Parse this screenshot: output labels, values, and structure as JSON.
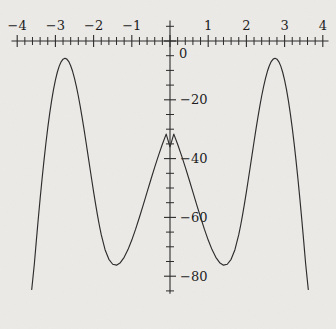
{
  "figure": {
    "background_color": "#eceae7",
    "ink_color": "#2a2a2a",
    "width": 336,
    "height": 329
  },
  "chart_data": {
    "type": "line",
    "title": "",
    "subtitle": "",
    "xlabel": "",
    "ylabel": "",
    "grid": false,
    "legend": null,
    "legend_position": "none",
    "xlim": [
      -4.15,
      4.15
    ],
    "ylim": [
      -86,
      10
    ],
    "x_major_ticks": [
      -4,
      -3,
      -2,
      -1,
      0,
      1,
      2,
      3,
      4
    ],
    "x_major_tick_labels": [
      "−4",
      "−3",
      "−2",
      "−1",
      "",
      "1",
      "2",
      "3",
      "4"
    ],
    "x_minor_tick_step": 0.2,
    "y_major_ticks": [
      0,
      -20,
      -40,
      -60,
      -80
    ],
    "y_major_tick_labels": [
      "0",
      "−20",
      "−40",
      "−60",
      "−80"
    ],
    "y_minor_tick_step": 5,
    "equation": "y = -(x^2 - 4)(x^2 - 9)",
    "roots": [
      -3,
      -2,
      2,
      3
    ],
    "local_maxima": [
      {
        "x": -2.5495,
        "y": 6.25
      },
      {
        "x": 2.5495,
        "y": 6.25
      }
    ],
    "local_minima": [
      {
        "x": 0,
        "y": -36
      }
    ],
    "series": [
      {
        "name": "quartic",
        "color": "#2b2b2b",
        "x": [
          -3.62,
          -3.55,
          -3.5,
          -3.45,
          -3.4,
          -3.35,
          -3.3,
          -3.25,
          -3.2,
          -3.15,
          -3.1,
          -3.05,
          -3.0,
          -2.95,
          -2.9,
          -2.85,
          -2.8,
          -2.75,
          -2.7,
          -2.65,
          -2.6,
          -2.55,
          -2.5,
          -2.45,
          -2.4,
          -2.35,
          -2.3,
          -2.25,
          -2.2,
          -2.15,
          -2.1,
          -2.05,
          -2.0,
          -1.95,
          -1.9,
          -1.85,
          -1.8,
          -1.7,
          -1.6,
          -1.5,
          -1.4,
          -1.3,
          -1.2,
          -1.1,
          -1.0,
          -0.9,
          -0.8,
          -0.7,
          -0.6,
          -0.5,
          -0.4,
          -0.3,
          -0.2,
          -0.1,
          0.0,
          0.1,
          0.2,
          0.3,
          0.4,
          0.5,
          0.6,
          0.7,
          0.8,
          0.9,
          1.0,
          1.1,
          1.2,
          1.3,
          1.4,
          1.5,
          1.6,
          1.7,
          1.8,
          1.85,
          1.9,
          1.95,
          2.0,
          2.05,
          2.1,
          2.15,
          2.2,
          2.25,
          2.3,
          2.35,
          2.4,
          2.45,
          2.5,
          2.55,
          2.6,
          2.65,
          2.7,
          2.75,
          2.8,
          2.85,
          2.9,
          2.95,
          3.0,
          3.05,
          3.1,
          3.15,
          3.2,
          3.25,
          3.3,
          3.35,
          3.4,
          3.45,
          3.5,
          3.55,
          3.62
        ],
        "y": [
          -84.52,
          -75.68,
          -68.06,
          -60.71,
          -53.68,
          -47.02,
          -40.76,
          -34.93,
          -29.57,
          -24.7,
          -20.35,
          -16.54,
          -13.3,
          -10.63,
          -8.55,
          -7.07,
          -6.18,
          -5.88,
          -6.16,
          -7.01,
          -8.4,
          -10.31,
          -12.69,
          -15.5,
          -18.71,
          -22.25,
          -26.06,
          -30.09,
          -34.27,
          -38.55,
          -42.85,
          -47.12,
          -51.3,
          -55.33,
          -59.14,
          -62.67,
          -65.86,
          -70.98,
          -74.26,
          -75.94,
          -76.25,
          -75.39,
          -73.57,
          -70.95,
          -67.71,
          -64.0,
          -59.96,
          -55.72,
          -51.4,
          -47.1,
          -42.91,
          -38.9,
          -35.13,
          -31.66,
          -36.0,
          -31.66,
          -35.13,
          -38.9,
          -42.91,
          -47.1,
          -51.4,
          -55.72,
          -59.96,
          -64.0,
          -67.71,
          -70.95,
          -73.57,
          -75.39,
          -76.25,
          -75.94,
          -74.26,
          -70.98,
          -65.86,
          -62.67,
          -59.14,
          -55.33,
          -51.3,
          -47.12,
          -42.85,
          -38.55,
          -34.27,
          -30.09,
          -26.06,
          -22.25,
          -18.71,
          -15.5,
          -12.69,
          -10.31,
          -8.4,
          -7.01,
          -6.16,
          -5.88,
          -6.18,
          -7.07,
          -8.55,
          -10.63,
          -13.3,
          -16.54,
          -20.35,
          -24.7,
          -29.57,
          -34.93,
          -40.76,
          -47.02,
          -53.68,
          -60.71,
          -68.06,
          -75.68,
          -84.52
        ]
      }
    ]
  },
  "accessibility": {
    "description": "Plot of a downward quartic with roots at minus 3, minus 2, 2 and 3"
  }
}
